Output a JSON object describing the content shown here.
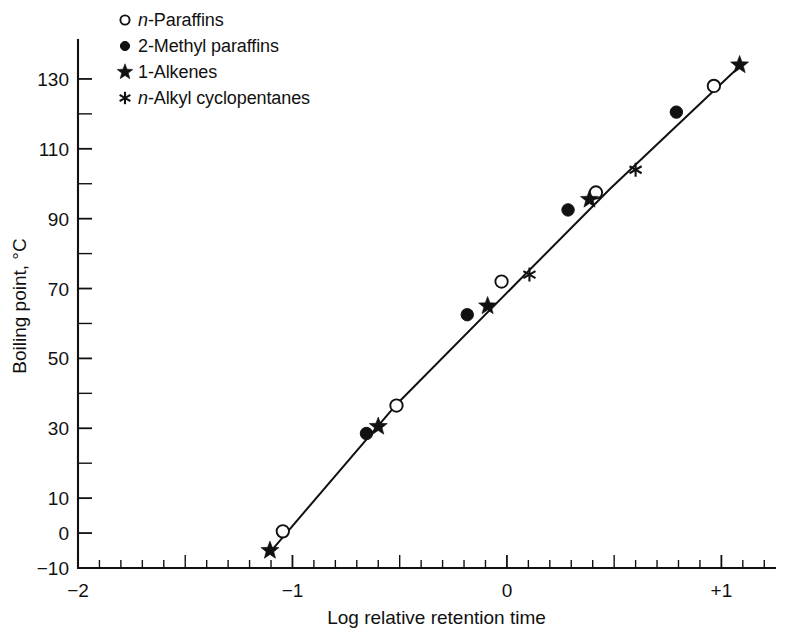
{
  "chart_data": {
    "type": "scatter",
    "title": "",
    "xlabel": "Log relative retention time",
    "ylabel": "Boiling point, °C",
    "xlim": [
      -2,
      1.25
    ],
    "ylim": [
      -10,
      140
    ],
    "xticks": [
      -2,
      -1,
      0,
      1
    ],
    "xtick_labels": [
      "−2",
      "−1",
      "0",
      "+1"
    ],
    "xtick_minor_step": 0.1,
    "yticks": [
      -10,
      0,
      10,
      30,
      50,
      70,
      90,
      110,
      130
    ],
    "ytick_labels": [
      "−10",
      "0",
      "10",
      "30",
      "50",
      "70",
      "90",
      "110",
      "130"
    ],
    "ytick_minor": [
      20,
      40,
      60,
      80,
      100,
      120
    ],
    "grid": false,
    "legend_position": "top-left",
    "line_color": "#111111",
    "marker_color": "#111111",
    "fit_line": {
      "name": "correlation line",
      "points": [
        {
          "x": -1.105,
          "y": -5.5
        },
        {
          "x": -0.52,
          "y": 36.5
        },
        {
          "x": 0.06,
          "y": 72.5
        },
        {
          "x": 0.48,
          "y": 98.5
        },
        {
          "x": 1.1,
          "y": 134.5
        }
      ]
    },
    "series": [
      {
        "name": "n-Paraffins",
        "label_html": "<span class=\"ital\">n</span>-Paraffins",
        "marker": "open-circle",
        "points": [
          {
            "x": -1.045,
            "y": 0.5
          },
          {
            "x": -0.515,
            "y": 36.5
          },
          {
            "x": -0.025,
            "y": 72.0
          },
          {
            "x": 0.415,
            "y": 97.5
          },
          {
            "x": 0.965,
            "y": 128.0
          }
        ]
      },
      {
        "name": "2-Methyl paraffins",
        "label_html": "2-Methyl paraffins",
        "marker": "filled-circle",
        "points": [
          {
            "x": -0.655,
            "y": 28.5
          },
          {
            "x": -0.185,
            "y": 62.5
          },
          {
            "x": 0.285,
            "y": 92.5
          },
          {
            "x": 0.79,
            "y": 120.5
          }
        ]
      },
      {
        "name": "1-Alkenes",
        "label_html": "1-Alkenes",
        "marker": "star",
        "points": [
          {
            "x": -1.105,
            "y": -5.0
          },
          {
            "x": -0.6,
            "y": 30.5
          },
          {
            "x": -0.09,
            "y": 65.0
          },
          {
            "x": 0.385,
            "y": 95.5
          },
          {
            "x": 1.085,
            "y": 134.0
          }
        ]
      },
      {
        "name": "n-Alkyl cyclopentanes",
        "label_html": "<span class=\"ital\">n</span>-Alkyl cyclopentanes",
        "marker": "asterisk",
        "points": [
          {
            "x": 0.105,
            "y": 74.0
          },
          {
            "x": 0.6,
            "y": 104.0
          }
        ]
      }
    ]
  },
  "legend": {
    "items": [
      {
        "marker": "open-circle",
        "label_html": "<span class=\"ital\">n</span>-Paraffins"
      },
      {
        "marker": "filled-circle",
        "label_html": "2-Methyl paraffins"
      },
      {
        "marker": "star",
        "label_html": "1-Alkenes"
      },
      {
        "marker": "asterisk",
        "label_html": "<span class=\"ital\">n</span>-Alkyl cyclopentanes"
      }
    ]
  }
}
